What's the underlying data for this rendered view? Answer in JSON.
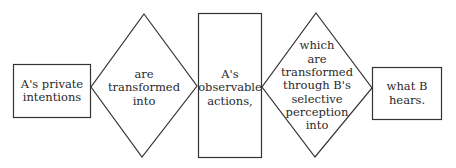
{
  "diagram": {
    "type": "flow",
    "stroke_color": "#333333",
    "nodes": [
      {
        "id": "n1",
        "shape": "rectangle",
        "text": "A's private\nintentions"
      },
      {
        "id": "n2",
        "shape": "diamond",
        "text": "are\ntransformed\ninto"
      },
      {
        "id": "n3",
        "shape": "rectangle",
        "text": "A's\nobservable\nactions,"
      },
      {
        "id": "n4",
        "shape": "diamond",
        "text": "which\nare\ntransformed\nthrough B's\nselective\nperception\ninto"
      },
      {
        "id": "n5",
        "shape": "rectangle",
        "text": "what B\nhears."
      }
    ]
  }
}
